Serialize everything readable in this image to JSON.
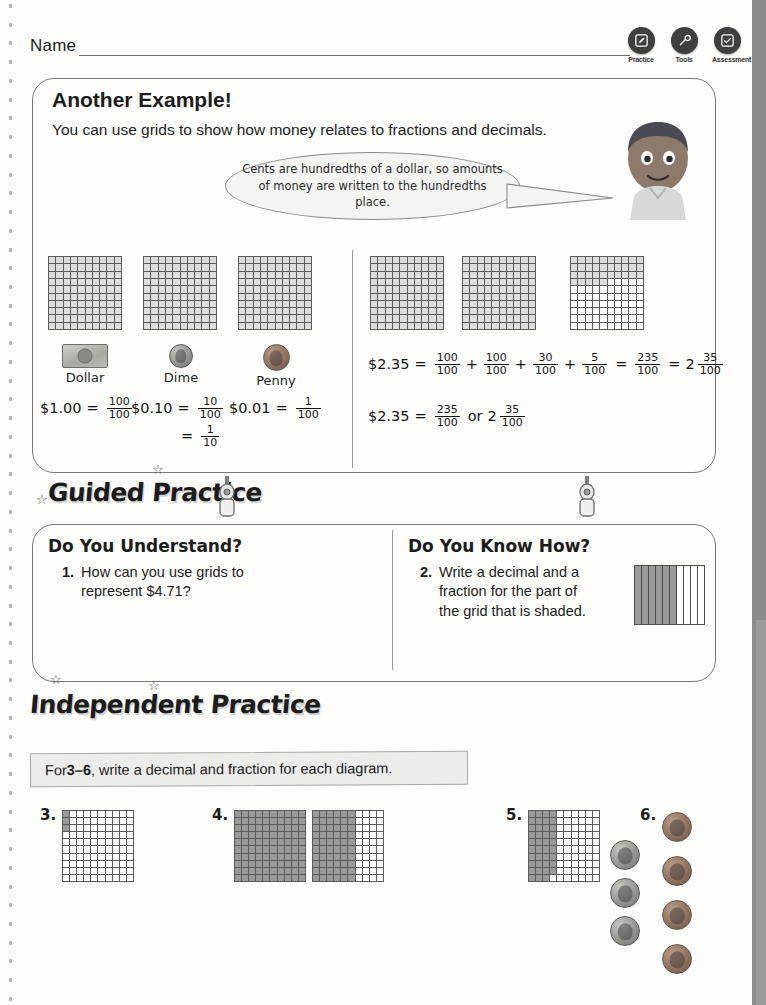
{
  "header": {
    "name_label": "Name",
    "tools": [
      {
        "label": "Practice",
        "icon": "pencil-icon"
      },
      {
        "label": "Tools",
        "icon": "wrench-icon"
      },
      {
        "label": "Assessment",
        "icon": "check-icon"
      }
    ]
  },
  "example": {
    "title": "Another Example!",
    "subtitle": "You can use grids to show how money relates to fractions and decimals.",
    "bubble": "Cents are hundredths of a dollar, so amounts of money are written to the hundredths place.",
    "coins": [
      {
        "name": "Dollar",
        "icon": "dollar-bill-icon",
        "amount": "$1.00",
        "fraction": "100/100"
      },
      {
        "name": "Dime",
        "icon": "dime-coin-icon",
        "amount": "$0.10",
        "fraction": "10/100",
        "alt_fraction": "1/10"
      },
      {
        "name": "Penny",
        "icon": "penny-coin-icon",
        "amount": "$0.01",
        "fraction": "1/100"
      }
    ],
    "eq_dollar": {
      "amount": "$1.00",
      "eq": "=",
      "num": "100",
      "den": "100"
    },
    "eq_dime": {
      "amount": "$0.10",
      "eq": "=",
      "num": "10",
      "den": "100"
    },
    "eq_dime2": {
      "eq": "=",
      "num": "1",
      "den": "10"
    },
    "eq_penny": {
      "amount": "$0.01",
      "eq": "=",
      "num": "1",
      "den": "100"
    },
    "eq_235a": {
      "amount": "$2.35",
      "eq": "=",
      "terms": [
        {
          "num": "100",
          "den": "100"
        },
        {
          "num": "100",
          "den": "100"
        },
        {
          "num": "30",
          "den": "100"
        },
        {
          "num": "5",
          "den": "100"
        }
      ],
      "plus": "+",
      "sum": {
        "num": "235",
        "den": "100"
      },
      "mixed_whole": "2",
      "mixed_num": "35",
      "mixed_den": "100"
    },
    "eq_235b": {
      "amount": "$2.35",
      "eq": "=",
      "improper_num": "235",
      "improper_den": "100",
      "or": "or",
      "mixed_whole": "2",
      "mixed_num": "35",
      "mixed_den": "100"
    }
  },
  "guided": {
    "banner": "Guided Practice",
    "left_title": "Do You Understand?",
    "right_title": "Do You Know How?",
    "q1_num": "1.",
    "q1_text": "How can you use grids to represent $4.71?",
    "q2_num": "2.",
    "q2_text": "Write a decimal and a fraction for the part of the grid that is shaded."
  },
  "independent": {
    "banner": "Independent Practice",
    "instruction_prefix": "For ",
    "instruction_range": "3–6",
    "instruction_suffix": ", write a decimal and fraction for each diagram.",
    "problems": [
      {
        "num": "3.",
        "type": "grid",
        "grids": 1
      },
      {
        "num": "4.",
        "type": "grid",
        "grids": 2
      },
      {
        "num": "5.",
        "type": "grid",
        "grids": 1
      },
      {
        "num": "6.",
        "type": "coins",
        "dimes": 3,
        "pennies": 4
      }
    ]
  },
  "chart_data": {
    "type": "heatmap",
    "grids": [
      {
        "id": "ex-grid-1",
        "label": "dollar grid 1",
        "shaded_cells": 100,
        "total": 100,
        "value": "100/100",
        "fill": "light"
      },
      {
        "id": "ex-grid-2",
        "label": "dollar grid 2",
        "shaded_cells": 100,
        "total": 100,
        "value": "100/100",
        "fill": "light"
      },
      {
        "id": "ex-grid-3",
        "label": "dollar grid 3",
        "shaded_cells": 100,
        "total": 100,
        "value": "100/100",
        "fill": "light"
      },
      {
        "id": "ex-grid-4",
        "label": "$2.35 grid 1",
        "shaded_cells": 100,
        "total": 100,
        "value": "100/100",
        "fill": "light"
      },
      {
        "id": "ex-grid-5",
        "label": "$2.35 grid 2",
        "shaded_cells": 100,
        "total": 100,
        "value": "100/100",
        "fill": "light"
      },
      {
        "id": "ex-grid-6",
        "label": "$2.35 grid 3",
        "shaded_cells": 35,
        "total": 100,
        "value": "35/100",
        "fill": "light"
      },
      {
        "id": "q2-grid",
        "label": "Do You Know How? grid",
        "shaded_columns": 6,
        "total_columns": 10,
        "value": "0.6"
      },
      {
        "id": "p3-grid",
        "label": "problem 3 grid",
        "shaded_cells": 3,
        "total": 100,
        "value": "3/100"
      },
      {
        "id": "p4-grid-a",
        "label": "problem 4 grid A",
        "shaded_cells": 100,
        "total": 100,
        "value": "100/100"
      },
      {
        "id": "p4-grid-b",
        "label": "problem 4 grid B",
        "shaded_cells": 60,
        "total": 100,
        "value": "60/100"
      },
      {
        "id": "p5-grid",
        "label": "problem 5 grid",
        "shaded_cells": 39,
        "total": 100,
        "value": "39/100"
      }
    ]
  }
}
